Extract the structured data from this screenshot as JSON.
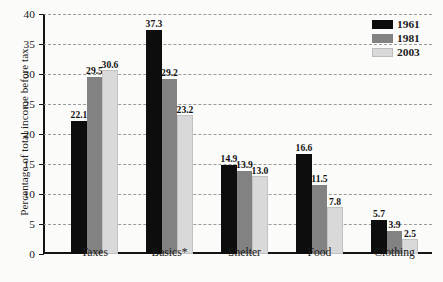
{
  "chart_data": {
    "type": "bar",
    "title": "",
    "xlabel": "",
    "ylabel": "Percentage of total income before tax",
    "ylim": [
      0,
      40
    ],
    "yticks": [
      0,
      5,
      10,
      15,
      20,
      25,
      30,
      35,
      40
    ],
    "grid": true,
    "legend_position": "top-right",
    "categories": [
      "Taxes",
      "Basics*",
      "Shelter",
      "Food",
      "Clothing"
    ],
    "series": [
      {
        "name": "1961",
        "color": "#0d0d0d",
        "values": [
          22.1,
          37.3,
          14.9,
          16.6,
          5.7
        ]
      },
      {
        "name": "1981",
        "color": "#828282",
        "values": [
          29.5,
          29.2,
          13.9,
          11.5,
          3.9
        ]
      },
      {
        "name": "2003",
        "color": "#d9d9d9",
        "values": [
          30.6,
          23.2,
          13.0,
          7.8,
          2.5
        ]
      }
    ],
    "value_labels": [
      [
        "22.1",
        "29.5",
        "30.6"
      ],
      [
        "37.3",
        "29.2",
        "23.2"
      ],
      [
        "14.9",
        "13.9",
        "13.0"
      ],
      [
        "16.6",
        "11.5",
        "7.8"
      ],
      [
        "5.7",
        "3.9",
        "2.5"
      ]
    ]
  },
  "axis": {
    "y_title": "Percentage of total income before tax",
    "y_tick_labels": [
      "0",
      "5",
      "10",
      "15",
      "20",
      "25",
      "30",
      "35",
      "40"
    ]
  },
  "legend": {
    "entries": [
      {
        "label": "1961"
      },
      {
        "label": "1981"
      },
      {
        "label": "2003"
      }
    ]
  },
  "artifact": {
    "top_crop_text": "·  ·"
  }
}
